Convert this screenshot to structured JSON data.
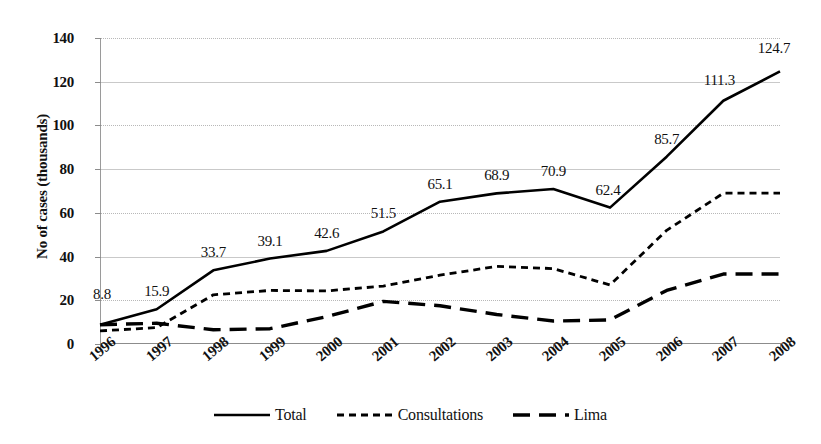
{
  "chart_data": {
    "type": "line",
    "title": "",
    "xlabel": "",
    "ylabel": "No of cases (thousands)",
    "categories": [
      "1996",
      "1997",
      "1998",
      "1999",
      "2000",
      "2001",
      "2002",
      "2003",
      "2004",
      "2005",
      "2006",
      "2007",
      "2008"
    ],
    "ylim": [
      0,
      140
    ],
    "ytick_labels": [
      "0",
      "20",
      "40",
      "60",
      "80",
      "100",
      "120",
      "140"
    ],
    "yticks": [
      0,
      20,
      40,
      60,
      80,
      100,
      120,
      140
    ],
    "grid": true,
    "legend_position": "bottom",
    "series": [
      {
        "name": "Total",
        "style": "solid",
        "values": [
          8.8,
          15.9,
          33.7,
          39.1,
          42.6,
          51.5,
          65.1,
          68.9,
          70.9,
          62.4,
          85.7,
          111.3,
          124.7
        ],
        "data_labels": [
          "8.8",
          "15.9",
          "33.7",
          "39.1",
          "42.6",
          "51.5",
          "65.1",
          "68.9",
          "70.9",
          "62.4",
          "85.7",
          "111.3",
          "124.7"
        ]
      },
      {
        "name": "Consultations",
        "style": "dotted",
        "values": [
          6.0,
          7.5,
          22.5,
          24.5,
          24.3,
          26.5,
          31.5,
          35.5,
          34.5,
          27.0,
          52.0,
          69.0,
          69.0
        ]
      },
      {
        "name": "Lima",
        "style": "dashed",
        "values": [
          8.8,
          9.5,
          6.5,
          7.0,
          12.5,
          19.5,
          17.5,
          13.5,
          10.5,
          11.0,
          24.5,
          32.0,
          32.0
        ]
      }
    ]
  },
  "legend": {
    "items": [
      {
        "label": "Total",
        "style": "solid"
      },
      {
        "label": "Consultations",
        "style": "dotted"
      },
      {
        "label": "Lima",
        "style": "dashed"
      }
    ]
  },
  "colors": {
    "line": "#000000",
    "grid": "#c9c9c9",
    "axis": "#8c8c8c",
    "text": "#111111",
    "background": "#ffffff"
  }
}
